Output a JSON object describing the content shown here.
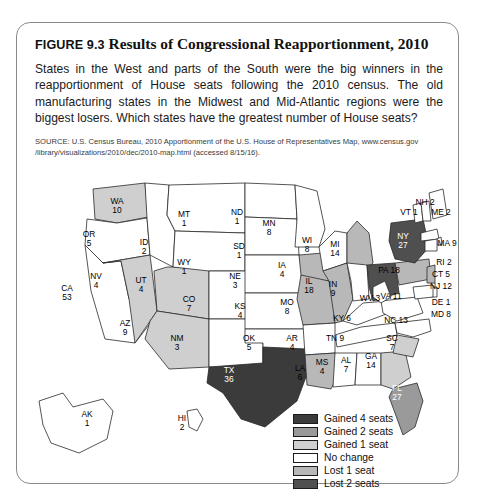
{
  "figure": {
    "label": "FIGURE 9.3",
    "title": "Results of Congressional Reapportionment, 2010",
    "description": "States in the West and parts of the South were the big winners in the reapportionment of House seats following the 2010 census. The old manufacturing states in the Midwest and Mid-Atlantic regions were the biggest losers. Which states have the greatest number of House seats?",
    "source": "SOURCE: U.S. Census Bureau, 2010 Apportionment of the U.S. House of Representatives Map, www.census.gov /library/visualizations/2010/dec/2010-map.html (accessed 8/15/16)."
  },
  "legend": {
    "items": [
      {
        "label": "Gained 4 seats",
        "color": "#3b3b3b"
      },
      {
        "label": "Gained 2 seats",
        "color": "#9a9a9a"
      },
      {
        "label": "Gained 1 seat",
        "color": "#cfcfcf"
      },
      {
        "label": "No change",
        "color": "#ffffff"
      },
      {
        "label": "Lost 1 seat",
        "color": "#b8b8b8"
      },
      {
        "label": "Lost 2 seats",
        "color": "#4f4f4f"
      }
    ]
  },
  "chart_data": {
    "type": "map",
    "title": "Results of Congressional Reapportionment, 2010",
    "value_label": "House seats after 2010 reapportionment",
    "category_label": "Seat change category",
    "categories": [
      "Gained 4 seats",
      "Gained 2 seats",
      "Gained 1 seat",
      "No change",
      "Lost 1 seat",
      "Lost 2 seats"
    ],
    "category_colors": [
      "#3b3b3b",
      "#9a9a9a",
      "#cfcfcf",
      "#ffffff",
      "#b8b8b8",
      "#4f4f4f"
    ],
    "states": [
      {
        "abbr": "WA",
        "seats": 10,
        "category": "Gained 1 seat",
        "x": 100,
        "y": 35
      },
      {
        "abbr": "OR",
        "seats": 5,
        "category": "No change",
        "x": 72,
        "y": 68
      },
      {
        "abbr": "CA",
        "seats": 53,
        "category": "No change",
        "x": 50,
        "y": 122
      },
      {
        "abbr": "ID",
        "seats": 2,
        "category": "No change",
        "x": 127,
        "y": 76
      },
      {
        "abbr": "NV",
        "seats": 4,
        "category": "Gained 1 seat",
        "x": 79,
        "y": 110
      },
      {
        "abbr": "UT",
        "seats": 4,
        "category": "Gained 1 seat",
        "x": 124,
        "y": 114
      },
      {
        "abbr": "AZ",
        "seats": 9,
        "category": "Gained 1 seat",
        "x": 108,
        "y": 157
      },
      {
        "abbr": "MT",
        "seats": 1,
        "category": "No change",
        "x": 167,
        "y": 48
      },
      {
        "abbr": "WY",
        "seats": 1,
        "category": "No change",
        "x": 167,
        "y": 96
      },
      {
        "abbr": "CO",
        "seats": 7,
        "category": "No change",
        "x": 172,
        "y": 133
      },
      {
        "abbr": "NM",
        "seats": 3,
        "category": "No change",
        "x": 160,
        "y": 172
      },
      {
        "abbr": "ND",
        "seats": 1,
        "category": "No change",
        "x": 220,
        "y": 46
      },
      {
        "abbr": "SD",
        "seats": 1,
        "category": "No change",
        "x": 222,
        "y": 80
      },
      {
        "abbr": "NE",
        "seats": 3,
        "category": "No change",
        "x": 218,
        "y": 110
      },
      {
        "abbr": "KS",
        "seats": 4,
        "category": "No change",
        "x": 223,
        "y": 140
      },
      {
        "abbr": "OK",
        "seats": 5,
        "category": "No change",
        "x": 232,
        "y": 172
      },
      {
        "abbr": "TX",
        "seats": 36,
        "category": "Gained 4 seats",
        "x": 212,
        "y": 204
      },
      {
        "abbr": "MN",
        "seats": 8,
        "category": "No change",
        "x": 252,
        "y": 57
      },
      {
        "abbr": "IA",
        "seats": 4,
        "category": "Lost 1 seat",
        "x": 265,
        "y": 99
      },
      {
        "abbr": "MO",
        "seats": 8,
        "category": "Lost 1 seat",
        "x": 270,
        "y": 136
      },
      {
        "abbr": "AR",
        "seats": 4,
        "category": "No change",
        "x": 275,
        "y": 172
      },
      {
        "abbr": "LA",
        "seats": 6,
        "category": "Lost 1 seat",
        "x": 283,
        "y": 202
      },
      {
        "abbr": "WI",
        "seats": 8,
        "category": "No change",
        "x": 290,
        "y": 74
      },
      {
        "abbr": "IL",
        "seats": 18,
        "category": "Lost 1 seat",
        "x": 292,
        "y": 115
      },
      {
        "abbr": "MS",
        "seats": 4,
        "category": "No change",
        "x": 305,
        "y": 196
      },
      {
        "abbr": "MI",
        "seats": 14,
        "category": "Lost 1 seat",
        "x": 318,
        "y": 78
      },
      {
        "abbr": "IN",
        "seats": 9,
        "category": "No change",
        "x": 316,
        "y": 118
      },
      {
        "abbr": "KY",
        "seats": 6,
        "category": "No change",
        "x": 325,
        "y": 148
      },
      {
        "abbr": "TN",
        "seats": 9,
        "category": "No change",
        "x": 318,
        "y": 168
      },
      {
        "abbr": "AL",
        "seats": 7,
        "category": "No change",
        "x": 329,
        "y": 194
      },
      {
        "abbr": "OH",
        "seats": 16,
        "category": "Lost 2 seats",
        "x": 343,
        "y": 112
      },
      {
        "abbr": "GA",
        "seats": 14,
        "category": "Gained 1 seat",
        "x": 354,
        "y": 190
      },
      {
        "abbr": "FL",
        "seats": 27,
        "category": "Gained 2 seats",
        "x": 380,
        "y": 222
      },
      {
        "abbr": "SC",
        "seats": 7,
        "category": "Gained 1 seat",
        "x": 375,
        "y": 172
      },
      {
        "abbr": "NC",
        "seats": 13,
        "category": "No change",
        "x": 379,
        "y": 150
      },
      {
        "abbr": "VA",
        "seats": 11,
        "category": "No change",
        "x": 374,
        "y": 126
      },
      {
        "abbr": "WV",
        "seats": 3,
        "category": "No change",
        "x": 353,
        "y": 128
      },
      {
        "abbr": "PA",
        "seats": 18,
        "category": "Lost 1 seat",
        "x": 372,
        "y": 100
      },
      {
        "abbr": "NY",
        "seats": 27,
        "category": "Lost 2 seats",
        "x": 386,
        "y": 70
      },
      {
        "abbr": "VT",
        "seats": 1,
        "category": "No change",
        "x": 392,
        "y": 42
      },
      {
        "abbr": "NH",
        "seats": 2,
        "category": "No change",
        "x": 408,
        "y": 32
      },
      {
        "abbr": "ME",
        "seats": 2,
        "category": "No change",
        "x": 424,
        "y": 42
      },
      {
        "abbr": "MA",
        "seats": 9,
        "category": "No change",
        "x": 430,
        "y": 73
      },
      {
        "abbr": "RI",
        "seats": 2,
        "category": "No change",
        "x": 427,
        "y": 92
      },
      {
        "abbr": "CT",
        "seats": 5,
        "category": "No change",
        "x": 424,
        "y": 104
      },
      {
        "abbr": "NJ",
        "seats": 12,
        "category": "Lost 1 seat",
        "x": 424,
        "y": 116
      },
      {
        "abbr": "DE",
        "seats": 1,
        "category": "No change",
        "x": 424,
        "y": 132
      },
      {
        "abbr": "MD",
        "seats": 8,
        "category": "No change",
        "x": 424,
        "y": 144
      },
      {
        "abbr": "AK",
        "seats": 1,
        "category": "No change",
        "x": 70,
        "y": 248
      },
      {
        "abbr": "HI",
        "seats": 2,
        "category": "No change",
        "x": 165,
        "y": 252
      }
    ]
  }
}
